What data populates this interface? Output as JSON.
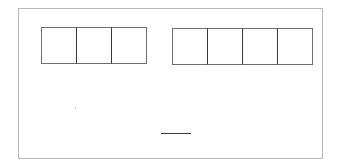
{
  "puzzle": {
    "left_group": {
      "box_count": 3,
      "values": [
        "",
        "",
        ""
      ]
    },
    "right_group": {
      "box_count": 4,
      "values": [
        "",
        "",
        "",
        ""
      ]
    },
    "answer_line": ""
  }
}
